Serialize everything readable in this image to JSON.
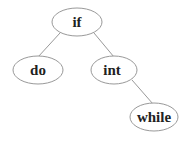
{
  "diagram": {
    "type": "binary-search-tree",
    "nodes": [
      {
        "id": "if",
        "label": "if"
      },
      {
        "id": "do",
        "label": "do"
      },
      {
        "id": "int",
        "label": "int"
      },
      {
        "id": "while",
        "label": "while"
      }
    ],
    "edges": [
      {
        "from": "if",
        "to": "do"
      },
      {
        "from": "if",
        "to": "int"
      },
      {
        "from": "int",
        "to": "while"
      }
    ]
  }
}
